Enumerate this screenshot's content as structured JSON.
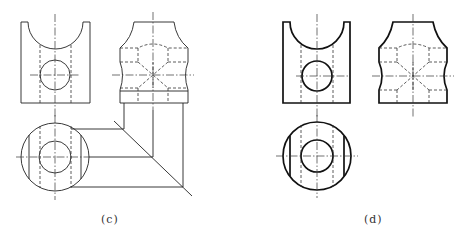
{
  "figure": {
    "panels": [
      {
        "id": "c",
        "label": "(c)",
        "description": "Three-view drawing with construction projection lines and 45-degree miter line"
      },
      {
        "id": "d",
        "label": "(d)",
        "description": "Finished three-view drawing with visible outlines in thick lines"
      }
    ],
    "views": [
      "front-view",
      "side-view",
      "top-view"
    ],
    "colors": {
      "line": "#222222",
      "background": "#ffffff"
    }
  }
}
